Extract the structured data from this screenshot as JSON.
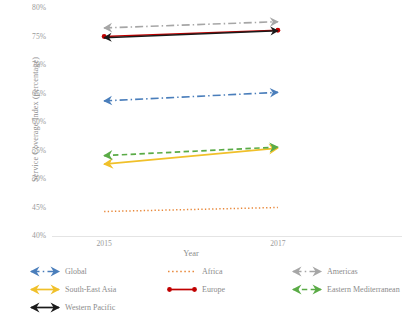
{
  "chart_data": {
    "type": "line",
    "title": "",
    "xlabel": "Year",
    "ylabel": "Service Coverage Index (percentage)",
    "x": [
      2015,
      2017
    ],
    "x_tick_labels": [
      "2015",
      "2017"
    ],
    "xlim": [
      2014.4,
      2017.6
    ],
    "ylim": [
      40,
      80
    ],
    "y_tick_labels": [
      "80%",
      "75%",
      "70%",
      "65%",
      "60%",
      "55%",
      "50%",
      "45%",
      "40%"
    ],
    "y_ticks": [
      80,
      75,
      70,
      65,
      60,
      55,
      50,
      45,
      40
    ],
    "grid": false,
    "legend_position": "bottom",
    "series": [
      {
        "name": "Global",
        "values": [
          63.7,
          65.2
        ],
        "color": "#4a7ebb",
        "style": "dash-dot",
        "marker": "arrow",
        "width": 1.6
      },
      {
        "name": "Africa",
        "values": [
          44.3,
          45.0
        ],
        "color": "#e8883a",
        "style": "dotted",
        "marker": "none",
        "width": 1.5
      },
      {
        "name": "Americas",
        "values": [
          76.5,
          77.6
        ],
        "color": "#a6a6a6",
        "style": "dash-dot",
        "marker": "arrow",
        "width": 1.6
      },
      {
        "name": "South-East Asia",
        "values": [
          52.6,
          55.4
        ],
        "color": "#f0c02a",
        "style": "solid",
        "marker": "arrow",
        "width": 1.8
      },
      {
        "name": "Europe",
        "values": [
          75.0,
          76.1
        ],
        "color": "#c00000",
        "style": "solid",
        "marker": "circle",
        "width": 1.6
      },
      {
        "name": "Eastern Mediterranean",
        "values": [
          54.1,
          55.6
        ],
        "color": "#5aab46",
        "style": "dashed",
        "marker": "arrow",
        "width": 1.7
      },
      {
        "name": "Western Pacific",
        "values": [
          74.8,
          76.0
        ],
        "color": "#1a1a1a",
        "style": "solid",
        "marker": "arrow",
        "width": 1.5
      }
    ]
  },
  "legend": {
    "entries": [
      {
        "label": "Global",
        "color": "#4a7ebb",
        "style": "dash-dot",
        "marker": "arrow",
        "col": 0,
        "row": 0
      },
      {
        "label": "Africa",
        "color": "#e8883a",
        "style": "dotted",
        "marker": "none",
        "col": 1,
        "row": 0
      },
      {
        "label": "Americas",
        "color": "#a6a6a6",
        "style": "dash-dot",
        "marker": "arrow",
        "col": 2,
        "row": 0
      },
      {
        "label": "South-East Asia",
        "color": "#f0c02a",
        "style": "solid",
        "marker": "arrow",
        "col": 0,
        "row": 1
      },
      {
        "label": "Europe",
        "color": "#c00000",
        "style": "solid",
        "marker": "circle",
        "col": 1,
        "row": 1
      },
      {
        "label": "Eastern Mediterranean",
        "color": "#5aab46",
        "style": "dashed",
        "marker": "arrow",
        "col": 2,
        "row": 1
      },
      {
        "label": "Western Pacific",
        "color": "#1a1a1a",
        "style": "solid",
        "marker": "arrow",
        "col": 0,
        "row": 2
      }
    ]
  },
  "axis_style": {
    "axis_line_color": "#e4e4e4",
    "tick_text_color": "#9a9a9a",
    "title_text_color": "#8c8c8c"
  }
}
